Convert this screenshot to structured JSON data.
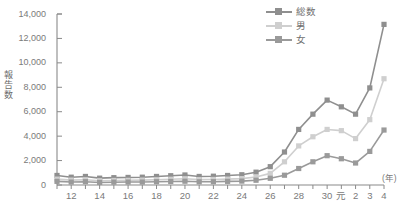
{
  "chart_data": {
    "type": "line",
    "title": "",
    "xlabel": "(年)",
    "ylabel": "報告数",
    "ylim": [
      0,
      14000
    ],
    "ytick_values": [
      0,
      2000,
      4000,
      6000,
      8000,
      10000,
      12000,
      14000
    ],
    "ytick_labels": [
      "0",
      "2,000",
      "4,000",
      "6,000",
      "8,000",
      "10,000",
      "12,000",
      "14,000"
    ],
    "grid": false,
    "legend_position": "top-right",
    "x": [
      "11",
      "12",
      "13",
      "14",
      "15",
      "16",
      "17",
      "18",
      "19",
      "20",
      "21",
      "22",
      "23",
      "24",
      "25",
      "26",
      "27",
      "28",
      "29",
      "30",
      "元",
      "2",
      "3",
      "4"
    ],
    "xtick_labels": [
      "12",
      "14",
      "16",
      "18",
      "20",
      "22",
      "24",
      "26",
      "28",
      "30",
      "元",
      "2",
      "3",
      "4"
    ],
    "xtick_indices": [
      1,
      3,
      5,
      7,
      9,
      11,
      13,
      15,
      17,
      19,
      20,
      21,
      22,
      23
    ],
    "series": [
      {
        "name": "総数",
        "color": "#8f8f8f",
        "values": [
          780,
          640,
          700,
          560,
          600,
          620,
          640,
          700,
          760,
          820,
          700,
          720,
          780,
          840,
          1050,
          1500,
          2700,
          4550,
          5800,
          6950,
          6400,
          5800,
          7950,
          13150
        ]
      },
      {
        "name": "男",
        "color": "#cfcfcf",
        "values": [
          480,
          400,
          430,
          350,
          370,
          380,
          400,
          430,
          470,
          510,
          440,
          450,
          480,
          520,
          660,
          950,
          1900,
          3200,
          3950,
          4550,
          4450,
          3800,
          5350,
          8700
        ]
      },
      {
        "name": "女",
        "color": "#9a9a9a",
        "values": [
          300,
          240,
          270,
          210,
          230,
          240,
          240,
          270,
          290,
          310,
          260,
          270,
          300,
          320,
          390,
          550,
          800,
          1350,
          1900,
          2400,
          2150,
          1800,
          2750,
          4500
        ]
      }
    ]
  },
  "axis": {
    "y_title": "報告数",
    "x_unit": "(年)"
  },
  "caption": {
    "text": ""
  }
}
